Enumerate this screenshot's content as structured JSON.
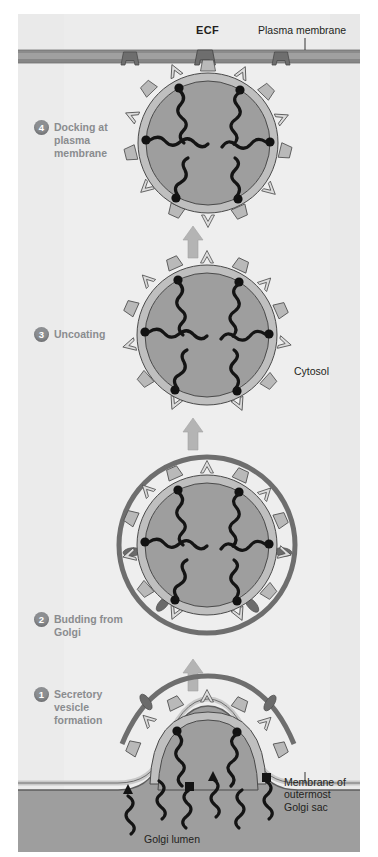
{
  "figure": {
    "width": 378,
    "height": 857
  },
  "labels": {
    "ecf": "ECF",
    "plasma_membrane": "Plasma membrane",
    "cytosol": "Cytosol",
    "golgi_membrane": "Membrane of\noutermost\nGolgi sac",
    "golgi_lumen": "Golgi lumen"
  },
  "stages": [
    {
      "number": "4",
      "label": "Docking at\nplasma\nmembrane"
    },
    {
      "number": "3",
      "label": "Uncoating"
    },
    {
      "number": "2",
      "label": "Budding from\nGolgi"
    },
    {
      "number": "1",
      "label": "Secretory\nvesicle\nformation"
    }
  ],
  "colors": {
    "background": "#f2f2f2",
    "cytosol": "#ededed",
    "ecf": "#e9e9e9",
    "membrane_band": "#9a9a9a",
    "membrane_band_light": "#b8b8b8",
    "vesicle_lumen": "#9c9c9c",
    "vesicle_membrane": "#b5b5b5",
    "coat_protein": "#a8a8a8",
    "clathrin_ring": "#6e6e6e",
    "cargo": "#1a1a1a",
    "receptor_dot": "#141414",
    "stage_badge": "#8d8f92",
    "stage_text": "#8a8c8f",
    "label_text": "#231f20",
    "arrow": "#b0b0b0"
  },
  "diagram_elements": {
    "vesicle_count": 4,
    "docking_proteins": 3,
    "cargo_strands_per_vesicle": 6,
    "receptor_dots_per_vesicle": 6,
    "golgi_cargo_strands": 6,
    "arrows_between_stages": 3
  }
}
